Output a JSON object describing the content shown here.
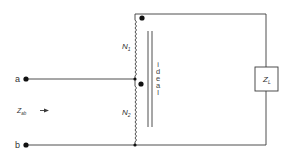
{
  "diagram": {
    "type": "ideal autotransformer circuit",
    "terminals": [
      {
        "id": "a",
        "label": "a"
      },
      {
        "id": "b",
        "label": "b"
      }
    ],
    "windings": [
      {
        "label_main": "N",
        "label_sub": "1"
      },
      {
        "label_main": "N",
        "label_sub": "2"
      }
    ],
    "core_label": [
      "i",
      "d",
      "e",
      "a",
      "l"
    ],
    "load": {
      "label_main": "Z",
      "label_sub": "L"
    },
    "input_impedance": {
      "label_main": "Z",
      "label_sub": "ab"
    },
    "colors": {
      "line": "#3a3a3a",
      "text": "#333333",
      "dot": "#111111"
    }
  }
}
